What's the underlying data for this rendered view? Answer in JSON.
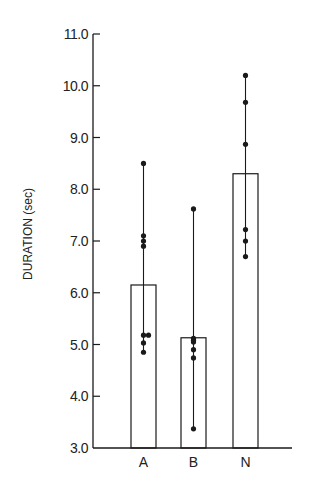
{
  "chart_data": {
    "type": "bar",
    "title": "",
    "xlabel": "",
    "ylabel": "DURATION (sec)",
    "ylim": [
      3.0,
      11.0
    ],
    "yticks": [
      3.0,
      4.0,
      5.0,
      6.0,
      7.0,
      8.0,
      9.0,
      10.0,
      11.0
    ],
    "ytick_labels": [
      "3.0",
      "4.0",
      "5.0",
      "6.0",
      "7.0",
      "8.0",
      "9.0",
      "10.0",
      "11.0"
    ],
    "grid": false,
    "legend": null,
    "categories": [
      "A",
      "B",
      "N"
    ],
    "values": [
      6.15,
      5.13,
      8.3
    ],
    "range_whiskers": [
      {
        "category": "A",
        "min": 4.85,
        "max": 8.5
      },
      {
        "category": "B",
        "min": 3.37,
        "max": 7.62
      },
      {
        "category": "N",
        "min": 6.7,
        "max": 10.2
      }
    ],
    "points": [
      {
        "category": "A",
        "values": [
          8.5,
          7.1,
          7.0,
          6.9,
          5.18,
          5.18,
          5.03,
          4.85
        ]
      },
      {
        "category": "B",
        "values": [
          7.62,
          5.12,
          5.08,
          5.05,
          4.9,
          4.74,
          3.37
        ]
      },
      {
        "category": "N",
        "values": [
          10.2,
          9.68,
          8.87,
          7.22,
          7.0,
          6.7
        ]
      }
    ],
    "colors": {
      "ink": "#1a1a1a",
      "bar_fill": "#ffffff",
      "background": "#ffffff"
    }
  }
}
